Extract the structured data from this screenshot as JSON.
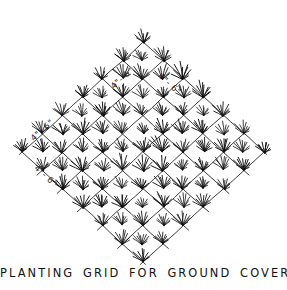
{
  "figure": {
    "caption": "PLANTING GRID FOR GROUND COVERS",
    "background_color": "#ffffff",
    "ink_color": "#111111",
    "media": "hand-drawn pen-and-ink landscape detail"
  },
  "dimension_labels": [
    {
      "text": "4\"- 6\"",
      "position": "upper-left-edge",
      "x": 44,
      "y": 132,
      "rotation": -42
    },
    {
      "text": "4\"- 6\"",
      "position": "lower-left-edge",
      "x": 44,
      "y": 178,
      "rotation": 42
    },
    {
      "text": "4\"- 6\"",
      "position": "top-center-left",
      "x": 124,
      "y": 80,
      "rotation": -42
    },
    {
      "text": "4\"- 6\"",
      "position": "top-center-right",
      "x": 168,
      "y": 86,
      "rotation": 42
    }
  ],
  "chart_data": {
    "type": "diagram",
    "title": "PLANTING GRID FOR GROUND COVERS",
    "grid": {
      "shape": "diamond",
      "center": [
        143,
        152
      ],
      "half_width": 121,
      "half_height": 110,
      "divisions": 6,
      "cell_spacing_px": 40,
      "line_overshoot_px": 7,
      "spacing_label": "4\"- 6\"",
      "spacing_min_inches": 4,
      "spacing_max_inches": 6
    },
    "plant_symbol": "grass-tuft",
    "plant_placement": "at every lattice intersection and at every cell center",
    "plant_count_visible": 56
  }
}
